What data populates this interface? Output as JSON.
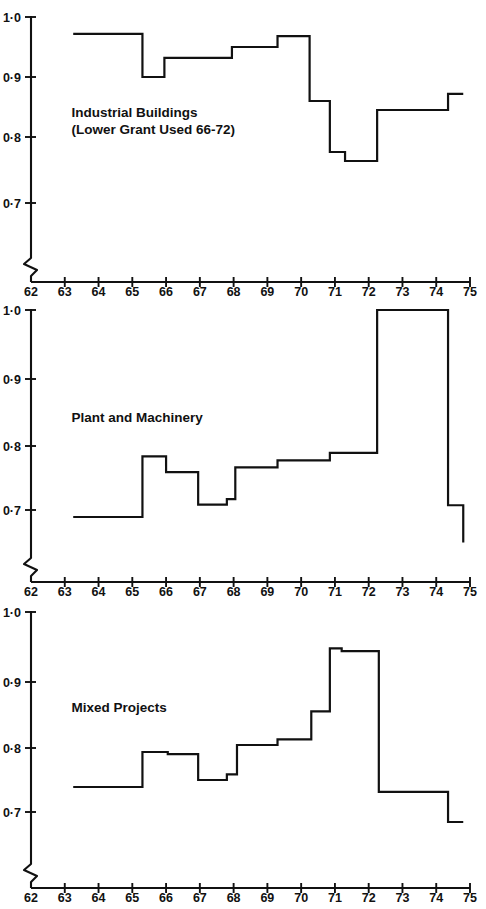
{
  "figure": {
    "width": 486,
    "height": 909,
    "background": "#ffffff",
    "ink_color": "#111111"
  },
  "chart_data": [
    {
      "type": "line",
      "title": "Industrial Buildings",
      "subtitle": "(Lower Grant Used 66-72)",
      "xlabel": "",
      "ylabel": "",
      "xlim": [
        62,
        75
      ],
      "ylim": [
        0.66,
        1.0
      ],
      "ytick_values": [
        1.0,
        0.9,
        0.8,
        0.7
      ],
      "ytick_labels": [
        "1·0",
        "0·9",
        "0·8",
        "0·7"
      ],
      "xtick_values": [
        62,
        63,
        64,
        65,
        66,
        67,
        68,
        69,
        70,
        71,
        72,
        73,
        74,
        75
      ],
      "xtick_labels": [
        "62",
        "63",
        "64",
        "65",
        "66",
        "67",
        "68",
        "69",
        "70",
        "71",
        "72",
        "73",
        "74",
        "75"
      ],
      "grid": false,
      "legend": "none",
      "axis_break_y": true,
      "step_style": "post",
      "x": [
        63.25,
        65.3,
        65.95,
        67.95,
        69.3,
        70.25,
        70.85,
        71.3,
        72.25,
        74.35,
        74.8
      ],
      "values": [
        0.972,
        0.9,
        0.932,
        0.95,
        0.968,
        0.86,
        0.775,
        0.76,
        0.845,
        0.872,
        0.872
      ]
    },
    {
      "type": "line",
      "title": "Plant and Machinery",
      "subtitle": "",
      "xlabel": "",
      "ylabel": "",
      "xlim": [
        62,
        75
      ],
      "ylim": [
        0.64,
        1.0
      ],
      "ytick_values": [
        1.0,
        0.9,
        0.8,
        0.7
      ],
      "ytick_labels": [
        "1·0",
        "0·9",
        "0·8",
        "0·7"
      ],
      "xtick_values": [
        62,
        63,
        64,
        65,
        66,
        67,
        68,
        69,
        70,
        71,
        72,
        73,
        74,
        75
      ],
      "xtick_labels": [
        "62",
        "63",
        "64",
        "65",
        "66",
        "67",
        "68",
        "69",
        "70",
        "71",
        "72",
        "73",
        "74",
        "75"
      ],
      "grid": false,
      "legend": "none",
      "axis_break_y": true,
      "step_style": "post",
      "x": [
        63.25,
        65.3,
        66.0,
        66.95,
        67.8,
        68.05,
        69.3,
        70.85,
        72.25,
        74.35,
        74.8
      ],
      "values": [
        0.7,
        0.788,
        0.765,
        0.718,
        0.726,
        0.772,
        0.782,
        0.793,
        1.0,
        0.717,
        0.663
      ]
    },
    {
      "type": "line",
      "title": "Mixed Projects",
      "subtitle": "",
      "xlabel": "",
      "ylabel": "",
      "xlim": [
        62,
        75
      ],
      "ylim": [
        0.66,
        1.0
      ],
      "ytick_values": [
        1.0,
        0.9,
        0.8,
        0.7
      ],
      "ytick_labels": [
        "1·0",
        "0·9",
        "0·8",
        "0·7"
      ],
      "xtick_values": [
        62,
        63,
        64,
        65,
        66,
        67,
        68,
        69,
        70,
        71,
        72,
        73,
        74,
        75
      ],
      "xtick_labels": [
        "62",
        "63",
        "64",
        "65",
        "66",
        "67",
        "68",
        "69",
        "70",
        "71",
        "72",
        "73",
        "74",
        "75"
      ],
      "grid": false,
      "legend": "none",
      "axis_break_y": true,
      "step_style": "post",
      "x": [
        63.25,
        65.3,
        66.05,
        66.95,
        67.8,
        68.1,
        69.3,
        70.3,
        70.85,
        71.2,
        72.3,
        74.35,
        74.8
      ],
      "values": [
        0.75,
        0.8,
        0.797,
        0.76,
        0.768,
        0.81,
        0.818,
        0.858,
        0.948,
        0.944,
        0.743,
        0.7,
        0.7
      ]
    }
  ]
}
